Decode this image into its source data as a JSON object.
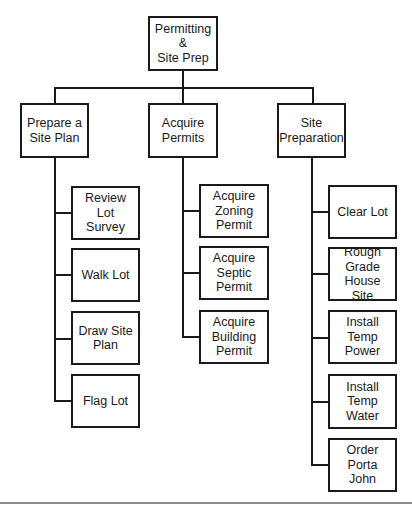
{
  "diagram": {
    "type": "wbs-tree",
    "root": {
      "label": "Permitting &\nSite Prep"
    },
    "branches": [
      {
        "label": "Prepare a\nSite Plan",
        "children": [
          "Review Lot\nSurvey",
          "Walk Lot",
          "Draw Site\nPlan",
          "Flag Lot"
        ]
      },
      {
        "label": "Acquire\nPermits",
        "children": [
          "Acquire\nZoning\nPermit",
          "Acquire\nSeptic\nPermit",
          "Acquire\nBuilding\nPermit"
        ]
      },
      {
        "label": "Site\nPreparation",
        "children": [
          "Clear Lot",
          "Rough\nGrade\nHouse Site",
          "Install Temp\nPower",
          "Install Temp\nWater",
          "Order Porta\nJohn"
        ]
      }
    ],
    "colors": {
      "line": "#1a1a1a",
      "box_fill": "#ffffff",
      "caption_rule": "#8a8a8a"
    }
  }
}
